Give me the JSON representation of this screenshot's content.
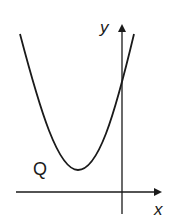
{
  "diagram": {
    "type": "parabola-graph",
    "labels": {
      "y_axis": "y",
      "x_axis": "x",
      "curve": "Q"
    },
    "colors": {
      "stroke": "#1a1a1a",
      "background": "#ffffff"
    },
    "geometry": {
      "origin": [
        122,
        192
      ],
      "curve_start": [
        20,
        34
      ],
      "curve_vertex": [
        78,
        170
      ],
      "curve_y_intercept": [
        122,
        82
      ],
      "curve_end": [
        134,
        34
      ]
    }
  }
}
